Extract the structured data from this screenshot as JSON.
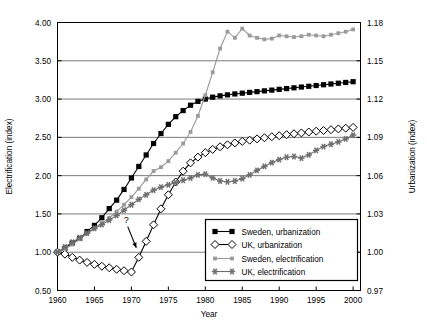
{
  "chart_data": {
    "type": "line",
    "title": "",
    "xlabel": "Year",
    "ylabel": "Electrification (index)",
    "y2label": "Urbanization (index)",
    "xlim": [
      1960,
      2001
    ],
    "ylim": [
      0.5,
      4.0
    ],
    "y2lim": [
      0.97,
      1.18
    ],
    "grid": "horizontal",
    "legend_position": "bottom-right",
    "xticks": [
      1960,
      1965,
      1970,
      1975,
      1980,
      1985,
      1990,
      1995,
      2000
    ],
    "xticklabels": [
      "1960",
      "1965",
      "1970",
      "1975",
      "1980",
      "1985",
      "1990",
      "1995",
      "2000"
    ],
    "yticks": [
      0.5,
      1.0,
      1.5,
      2.0,
      2.5,
      3.0,
      3.5,
      4.0
    ],
    "yticklabels": [
      "0.50",
      "1.00",
      "1.50",
      "2.00",
      "2.50",
      "3.00",
      "3.50",
      "4.00"
    ],
    "y2ticks": [
      0.97,
      1.0,
      1.03,
      1.06,
      1.09,
      1.12,
      1.15,
      1.18
    ],
    "y2ticklabels": [
      "0.97",
      "1.00",
      "1.03",
      "1.06",
      "1.09",
      "1.12",
      "1.15",
      "1.18"
    ],
    "annotations": [
      {
        "text": "?",
        "x": 1969.3,
        "y": 1.38,
        "arrow_to_x": 1971.0,
        "arrow_to_y": 1.02
      }
    ],
    "x": [
      1960,
      1961,
      1962,
      1963,
      1964,
      1965,
      1966,
      1967,
      1968,
      1969,
      1970,
      1971,
      1972,
      1973,
      1974,
      1975,
      1976,
      1977,
      1978,
      1979,
      1980,
      1981,
      1982,
      1983,
      1984,
      1985,
      1986,
      1987,
      1988,
      1989,
      1990,
      1991,
      1992,
      1993,
      1994,
      1995,
      1996,
      1997,
      1998,
      1999,
      2000
    ],
    "series": [
      {
        "name": "Sweden, urbanization",
        "axis": "right",
        "color": "#000000",
        "marker": "square-filled",
        "values_index": [
          1.0,
          1.003,
          1.007,
          1.011,
          1.016,
          1.021,
          1.027,
          1.034,
          1.041,
          1.049,
          1.058,
          1.067,
          1.076,
          1.085,
          1.093,
          1.1,
          1.106,
          1.111,
          1.115,
          1.118,
          1.12,
          1.1215,
          1.1225,
          1.1233,
          1.124,
          1.1246,
          1.1252,
          1.1258,
          1.1264,
          1.127,
          1.1276,
          1.1282,
          1.1288,
          1.1294,
          1.13,
          1.1306,
          1.1312,
          1.1318,
          1.1324,
          1.133,
          1.1336
        ],
        "values_left_scaled": [
          1.0,
          1.05,
          1.12,
          1.18,
          1.27,
          1.35,
          1.45,
          1.57,
          1.68,
          1.82,
          1.97,
          2.12,
          2.27,
          2.42,
          2.55,
          2.67,
          2.77,
          2.85,
          2.92,
          2.97,
          3.0,
          3.025,
          3.042,
          3.055,
          3.067,
          3.077,
          3.087,
          3.097,
          3.107,
          3.117,
          3.127,
          3.137,
          3.147,
          3.157,
          3.167,
          3.177,
          3.187,
          3.197,
          3.207,
          3.217,
          3.227
        ]
      },
      {
        "name": "UK, urbanization",
        "axis": "right",
        "color": "#000000",
        "marker": "diamond-open",
        "values_index": [
          1.0,
          0.9985,
          0.996,
          0.9938,
          0.992,
          0.9905,
          0.989,
          0.9878,
          0.9866,
          0.9855,
          0.9845,
          0.996,
          1.0085,
          1.0215,
          1.034,
          1.045,
          1.055,
          1.0635,
          1.07,
          1.0745,
          1.078,
          1.0806,
          1.0826,
          1.0842,
          1.0856,
          1.0868,
          1.0878,
          1.0888,
          1.0897,
          1.0905,
          1.0913,
          1.0921,
          1.0928,
          1.0935,
          1.0942,
          1.0948,
          1.0954,
          1.096,
          1.0966,
          1.0972,
          1.0978
        ],
        "values_left_scaled": [
          1.0,
          0.975,
          0.933,
          0.897,
          0.867,
          0.842,
          0.817,
          0.797,
          0.777,
          0.758,
          0.742,
          0.933,
          1.142,
          1.358,
          1.567,
          1.75,
          1.917,
          2.058,
          2.167,
          2.242,
          2.3,
          2.343,
          2.377,
          2.403,
          2.427,
          2.447,
          2.463,
          2.48,
          2.495,
          2.508,
          2.522,
          2.535,
          2.547,
          2.558,
          2.57,
          2.58,
          2.59,
          2.6,
          2.61,
          2.62,
          2.63
        ]
      },
      {
        "name": "Sweden, electrification",
        "axis": "left",
        "color": "#9a9a9a",
        "marker": "square-small",
        "values": [
          1.0,
          1.04,
          1.1,
          1.17,
          1.24,
          1.31,
          1.38,
          1.45,
          1.53,
          1.62,
          1.72,
          1.83,
          1.95,
          2.06,
          2.11,
          2.19,
          2.3,
          2.42,
          2.57,
          2.78,
          3.05,
          3.35,
          3.66,
          3.88,
          3.8,
          3.92,
          3.83,
          3.8,
          3.78,
          3.79,
          3.83,
          3.82,
          3.81,
          3.82,
          3.84,
          3.83,
          3.82,
          3.84,
          3.86,
          3.88,
          3.91
        ]
      },
      {
        "name": "UK, electrification",
        "axis": "left",
        "color": "#6e6e6e",
        "marker": "star",
        "values": [
          1.0,
          1.07,
          1.13,
          1.19,
          1.25,
          1.31,
          1.36,
          1.42,
          1.48,
          1.55,
          1.62,
          1.69,
          1.75,
          1.81,
          1.85,
          1.88,
          1.91,
          1.94,
          1.97,
          2.01,
          2.02,
          1.97,
          1.93,
          1.92,
          1.93,
          1.96,
          2.01,
          2.07,
          2.12,
          2.17,
          2.21,
          2.24,
          2.25,
          2.23,
          2.27,
          2.33,
          2.38,
          2.41,
          2.44,
          2.48,
          2.53
        ]
      }
    ]
  },
  "legend": {
    "entries": [
      {
        "label": "Sweden, urbanization"
      },
      {
        "label": "UK, urbanization"
      },
      {
        "label": "Sweden, electrification"
      },
      {
        "label": "UK, electrification"
      }
    ]
  },
  "colors": {
    "sweden_urbanization": "#000000",
    "uk_urbanization": "#000000",
    "sweden_electrification": "#9a9a9a",
    "uk_electrification": "#6e6e6e",
    "grid": "#6b6b6b",
    "axis": "#000000"
  }
}
